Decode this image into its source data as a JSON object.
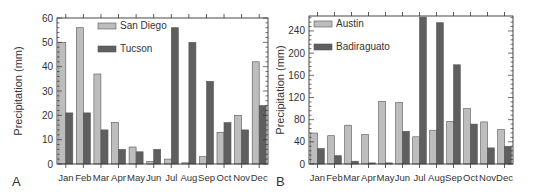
{
  "chart_data": [
    {
      "type": "bar",
      "panel_label": "A",
      "title": "",
      "xlabel": "",
      "ylabel": "Precipitation (mm)",
      "ylim": [
        0,
        60
      ],
      "yticks": [
        0,
        10,
        20,
        30,
        40,
        50,
        60
      ],
      "categories": [
        "Jan",
        "Feb",
        "Mar",
        "Apr",
        "May",
        "Jun",
        "Jul",
        "Aug",
        "Sep",
        "Oct",
        "Nov",
        "Dec"
      ],
      "series": [
        {
          "name": "San Diego",
          "color": "#bdbdbd",
          "values": [
            50,
            56,
            37,
            17,
            7,
            1,
            2,
            0.5,
            3,
            13,
            20,
            42
          ]
        },
        {
          "name": "Tucson",
          "color": "#5f5f5f",
          "values": [
            21,
            21,
            14,
            6,
            5,
            6,
            56,
            50,
            34,
            17,
            14,
            24
          ]
        }
      ],
      "legend_position": "upper-left-inside",
      "grid": false
    },
    {
      "type": "bar",
      "panel_label": "B",
      "title": "",
      "xlabel": "",
      "ylabel": "Precipitation (mm)",
      "ylim": [
        0,
        267
      ],
      "yticks": [
        0,
        40,
        80,
        120,
        160,
        200,
        240
      ],
      "categories": [
        "Jan",
        "Feb",
        "Mar",
        "Apr",
        "May",
        "Jun",
        "Jul",
        "Aug",
        "Sep",
        "Oct",
        "Nov",
        "Dec"
      ],
      "series": [
        {
          "name": "Austin",
          "color": "#bdbdbd",
          "values": [
            56,
            51,
            70,
            53,
            113,
            111,
            49,
            61,
            77,
            100,
            76,
            62
          ]
        },
        {
          "name": "Badiraguato",
          "color": "#5f5f5f",
          "values": [
            28,
            15,
            5,
            2,
            2,
            59,
            265,
            255,
            179,
            72,
            29,
            32
          ]
        }
      ],
      "legend_position": "upper-left-inside",
      "grid": false
    }
  ]
}
